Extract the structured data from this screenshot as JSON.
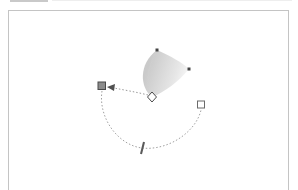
{
  "window": {
    "toolbar_tabs": [
      {
        "label": "",
        "active": true
      },
      {
        "label": "",
        "active": false
      }
    ]
  },
  "canvas": {
    "background": "#ffffff",
    "border_color": "#c4c4c4"
  },
  "gradient_object": {
    "type": "conical-gradient-wedge",
    "fill_start": "#cfcfcf",
    "fill_end": "#ffffff",
    "nodes": [
      {
        "name": "top-node",
        "x": 157,
        "y": 50
      },
      {
        "name": "right-node",
        "x": 189,
        "y": 69
      },
      {
        "name": "center-diamond",
        "x": 152,
        "y": 97
      }
    ]
  },
  "transform_handles": {
    "path_color": "#9a9a9a",
    "arrow_color": "#555555",
    "handles": [
      {
        "name": "rotation-start-handle",
        "shape": "square-filled",
        "x": 102,
        "y": 86,
        "color": "#707070"
      },
      {
        "name": "rotation-end-handle",
        "shape": "square-outline",
        "x": 201,
        "y": 105,
        "color": "#707070"
      },
      {
        "name": "skew-handle",
        "shape": "bar",
        "x": 142,
        "y": 148,
        "color": "#5a5a5a"
      },
      {
        "name": "center-handle",
        "shape": "diamond-outline",
        "x": 152,
        "y": 97,
        "color": "#505050"
      }
    ]
  }
}
